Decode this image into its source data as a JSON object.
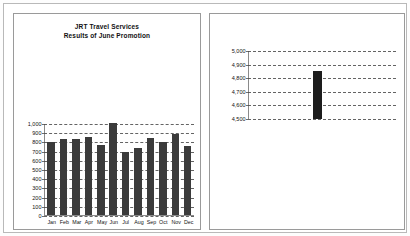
{
  "document": {
    "background_color": "#ffffff",
    "frame_color": "#b9b9b9"
  },
  "left_panel": {
    "name": "monthly-sales-chart-panel",
    "title_line_1": "JRT Travel Services",
    "title_line_2": "Results of June Promotion"
  },
  "right_panel": {
    "name": "summary-chart-panel"
  },
  "chart_data": [
    {
      "id": "left",
      "type": "bar",
      "title": "JRT Travel Services\nResults of June Promotion",
      "xlabel": "",
      "ylabel": "",
      "categories": [
        "Jan",
        "Feb",
        "Mar",
        "Apr",
        "May",
        "Jun",
        "Jul",
        "Aug",
        "Sep",
        "Oct",
        "Nov",
        "Dec"
      ],
      "values": [
        790,
        830,
        825,
        850,
        765,
        1000,
        685,
        725,
        840,
        790,
        880,
        750
      ],
      "ylim": [
        0,
        1000
      ],
      "ytick_labels": [
        "1,000",
        "900",
        "800",
        "700",
        "600",
        "500",
        "400",
        "300",
        "200",
        "100",
        "0"
      ],
      "ytick_values": [
        1000,
        900,
        800,
        700,
        600,
        500,
        400,
        300,
        200,
        100,
        0
      ],
      "grid": true,
      "legend": false,
      "bar_color": "#3b3b3b"
    },
    {
      "id": "right",
      "type": "bar",
      "title": "",
      "xlabel": "",
      "ylabel": "",
      "categories": [
        ""
      ],
      "values": [
        4850
      ],
      "ylim": [
        4500,
        5000
      ],
      "ytick_labels": [
        "5,000",
        "4,900",
        "4,800",
        "4,700",
        "4,600",
        "4,500"
      ],
      "ytick_values": [
        5000,
        4900,
        4800,
        4700,
        4600,
        4500
      ],
      "grid": true,
      "legend": false,
      "bar_color": "#1d1d1d"
    }
  ]
}
